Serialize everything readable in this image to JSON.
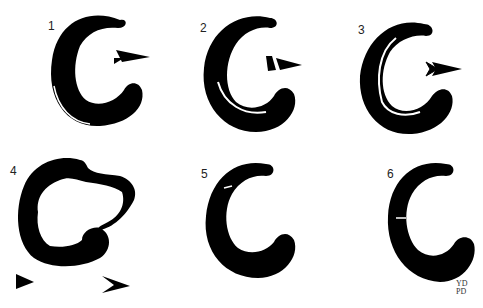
{
  "figure": {
    "ink_color": "#000000",
    "background_color": "#ffffff",
    "panels": [
      {
        "label": "1",
        "arrow": "narrow-wedge-arrow"
      },
      {
        "label": "2",
        "arrow": "split-wedge-arrow"
      },
      {
        "label": "3",
        "arrow": "chevron-arrow"
      },
      {
        "label": "4",
        "arrows": [
          "solid-triangle-arrowhead",
          "chevron-arrowhead"
        ]
      },
      {
        "label": "5"
      },
      {
        "label": "6",
        "signature": "YD\nPD"
      }
    ]
  }
}
